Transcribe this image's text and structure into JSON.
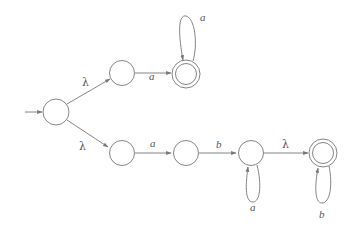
{
  "diagram": {
    "type": "finite automaton (NFA with lambda transitions)",
    "states": [
      {
        "id": "q0",
        "initial": true,
        "final": false
      },
      {
        "id": "q1",
        "initial": false,
        "final": false
      },
      {
        "id": "q2",
        "initial": false,
        "final": true
      },
      {
        "id": "q3",
        "initial": false,
        "final": false
      },
      {
        "id": "q4",
        "initial": false,
        "final": false
      },
      {
        "id": "q5",
        "initial": false,
        "final": false
      },
      {
        "id": "q6",
        "initial": false,
        "final": true
      }
    ],
    "transitions": [
      {
        "from": "q0",
        "to": "q1",
        "label": "λ"
      },
      {
        "from": "q1",
        "to": "q2",
        "label": "a"
      },
      {
        "from": "q2",
        "to": "q2",
        "label": "a"
      },
      {
        "from": "q0",
        "to": "q3",
        "label": "λ"
      },
      {
        "from": "q3",
        "to": "q4",
        "label": "a"
      },
      {
        "from": "q4",
        "to": "q5",
        "label": "b"
      },
      {
        "from": "q5",
        "to": "q5",
        "label": "a"
      },
      {
        "from": "q5",
        "to": "q6",
        "label": "λ"
      },
      {
        "from": "q6",
        "to": "q6",
        "label": "b"
      }
    ]
  }
}
